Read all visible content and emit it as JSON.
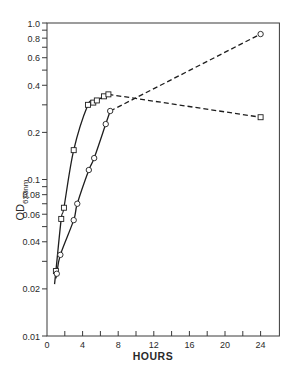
{
  "chart_data": {
    "type": "line",
    "title": "",
    "xlabel": "HOURS",
    "ylabel": "OD620nm",
    "ylabel_main": "OD",
    "ylabel_sub": "620nm",
    "yscale": "log",
    "xlim": [
      0,
      26
    ],
    "ylim": [
      0.01,
      1.0
    ],
    "grid": false,
    "legend": null,
    "x_ticks": [
      0,
      4,
      8,
      12,
      16,
      20,
      24
    ],
    "x_tick_labels": [
      "0",
      "4",
      "8",
      "12",
      "16",
      "20",
      "24"
    ],
    "x_minor_ticks": [
      2,
      6,
      10,
      14,
      18,
      22
    ],
    "y_ticks": [
      1.0,
      0.8,
      0.6,
      0.4,
      0.2,
      0.1,
      0.08,
      0.06,
      0.04,
      0.02,
      0.01
    ],
    "y_tick_labels": [
      "1.0",
      "0.8",
      "0.6",
      "0.4",
      "0.2",
      "0.1",
      "0.08",
      "0.06",
      "0.04",
      "0.02",
      "0.01"
    ],
    "y_minor_ticks": [
      0.9,
      0.7,
      0.5,
      0.3,
      0.09,
      0.07,
      0.05,
      0.03
    ],
    "series": [
      {
        "name": "squares",
        "marker": "square",
        "x": [
          1.0,
          1.6,
          1.9,
          3.0,
          4.6,
          5.2,
          5.6,
          6.4,
          6.9,
          24
        ],
        "y": [
          0.026,
          0.056,
          0.066,
          0.154,
          0.3,
          0.31,
          0.32,
          0.34,
          0.35,
          0.25
        ],
        "solid_until_index": 8,
        "dashed_from_index": 8
      },
      {
        "name": "circles",
        "marker": "circle",
        "x": [
          1.1,
          1.5,
          3.0,
          3.4,
          4.7,
          5.3,
          6.6,
          7.1,
          24
        ],
        "y": [
          0.025,
          0.033,
          0.055,
          0.07,
          0.115,
          0.137,
          0.226,
          0.274,
          0.85
        ],
        "solid_until_index": 7,
        "dashed_from_index": 7
      }
    ]
  }
}
